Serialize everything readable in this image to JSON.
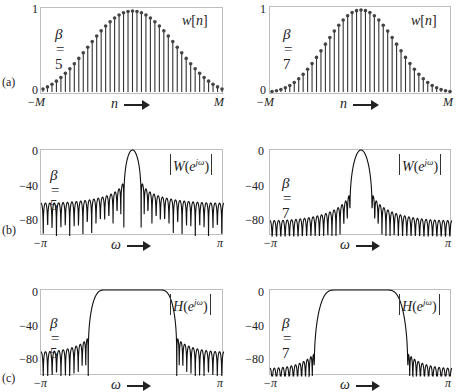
{
  "row_labels": [
    "(a)",
    "(b)",
    "(c)"
  ],
  "chart_data": [
    {
      "id": "a-left",
      "row": "(a)",
      "type": "stem",
      "title": "w[n]",
      "title_parts": {
        "fn": "w",
        "arg": "[n]"
      },
      "beta": 5,
      "beta_label": "β = 5",
      "xlabel": "n",
      "xticks": [
        "−M",
        "M"
      ],
      "yticks": [
        "1",
        "0"
      ],
      "ylim": [
        0,
        1
      ],
      "M": 20,
      "num_samples": 41,
      "description": "Kaiser window samples w[n] for n = -M..M, beta = 5"
    },
    {
      "id": "a-right",
      "row": "(a)",
      "type": "stem",
      "title": "w[n]",
      "title_parts": {
        "fn": "w",
        "arg": "[n]"
      },
      "beta": 7,
      "beta_label": "β = 7",
      "xlabel": "n",
      "xticks": [
        "−M",
        "M"
      ],
      "yticks": [
        "1",
        "0"
      ],
      "ylim": [
        0,
        1
      ],
      "M": 20,
      "num_samples": 41,
      "description": "Kaiser window samples w[n] for n = -M..M, beta = 7"
    },
    {
      "id": "b-left",
      "row": "(b)",
      "type": "line",
      "title": "|W(e^{jω})|",
      "title_parts": {
        "fn": "W",
        "sup": "jω"
      },
      "beta": 5,
      "beta_label": "β = 5",
      "xlabel": "ω",
      "xticks": [
        "−π",
        "π"
      ],
      "yticks": [
        "0",
        "−40",
        "−80"
      ],
      "ylim": [
        -95,
        0
      ],
      "yunit": "dB",
      "M": 20,
      "mainlobe_peak_db": 0,
      "sidelobe_level_db": -42,
      "sidelobe_floor_db": -60,
      "description": "Magnitude (dB) of Kaiser window spectrum, beta = 5"
    },
    {
      "id": "b-right",
      "row": "(b)",
      "type": "line",
      "title": "|W(e^{jω})|",
      "title_parts": {
        "fn": "W",
        "sup": "jω"
      },
      "beta": 7,
      "beta_label": "β = 7",
      "xlabel": "ω",
      "xticks": [
        "−π",
        "π"
      ],
      "yticks": [
        "0",
        "−40",
        "−80"
      ],
      "ylim": [
        -95,
        0
      ],
      "yunit": "dB",
      "M": 20,
      "mainlobe_peak_db": 0,
      "sidelobe_level_db": -54,
      "sidelobe_floor_db": -78,
      "description": "Magnitude (dB) of Kaiser window spectrum, beta = 7"
    },
    {
      "id": "c-left",
      "row": "(c)",
      "type": "line",
      "title": "|H(e^{jω})|",
      "title_parts": {
        "fn": "H",
        "sup": "jω"
      },
      "beta": 5,
      "beta_label": "β = 5",
      "xlabel": "ω",
      "xticks": [
        "−π",
        "π"
      ],
      "yticks": [
        "0",
        "−40",
        "−80"
      ],
      "ylim": [
        -95,
        0
      ],
      "yunit": "dB",
      "M": 20,
      "cutoff": 0.4,
      "passband_db": 0,
      "stopband_peak_db": -58,
      "stopband_floor_db": -70,
      "description": "Magnitude (dB) of lowpass filter designed with Kaiser window, beta = 5"
    },
    {
      "id": "c-right",
      "row": "(c)",
      "type": "line",
      "title": "|H(e^{jω})|",
      "title_parts": {
        "fn": "H",
        "sup": "jω"
      },
      "beta": 7,
      "beta_label": "β = 7",
      "xlabel": "ω",
      "xticks": [
        "−π",
        "π"
      ],
      "yticks": [
        "0",
        "−40",
        "−80"
      ],
      "ylim": [
        -95,
        0
      ],
      "yunit": "dB",
      "M": 20,
      "cutoff": 0.4,
      "passband_db": 0,
      "stopband_peak_db": -70,
      "stopband_floor_db": -85,
      "description": "Magnitude (dB) of lowpass filter designed with Kaiser window, beta = 7"
    }
  ]
}
